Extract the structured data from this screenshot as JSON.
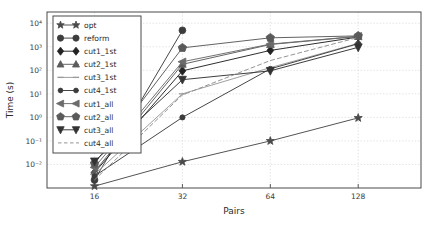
{
  "chart_data": {
    "type": "line",
    "title": "",
    "xlabel": "Pairs",
    "ylabel": "Time (s)",
    "xscale": "log2",
    "yscale": "log10",
    "x": [
      16,
      32,
      64,
      128
    ],
    "xticklabels": [
      "16",
      "32",
      "64",
      "128"
    ],
    "yticklabels": [
      "10⁴",
      "10³",
      "10²",
      "10¹",
      "10⁰",
      "10⁻¹",
      "10⁻²"
    ],
    "ylim": [
      0.001,
      30000
    ],
    "xlim": [
      11,
      210
    ],
    "grid": true,
    "legend_position": "upper-left",
    "series": [
      {
        "name": "opt",
        "marker": "star",
        "dash": "solid",
        "color": "#4a4a4a",
        "values": [
          0.0012,
          0.013,
          0.1,
          0.95
        ]
      },
      {
        "name": "reform",
        "marker": "circle",
        "dash": "solid",
        "color": "#3c3c3c",
        "values": [
          0.0022,
          5000,
          null,
          null
        ]
      },
      {
        "name": "cut1_1st",
        "marker": "diamond",
        "dash": "solid",
        "color": "#232323",
        "values": [
          0.0045,
          95,
          700,
          2600
        ]
      },
      {
        "name": "cut2_1st",
        "marker": "triangle-up",
        "dash": "solid",
        "color": "#5c5c5c",
        "values": [
          0.005,
          180,
          1250,
          2750
        ]
      },
      {
        "name": "cut3_1st",
        "marker": "hline",
        "dash": "solid",
        "color": "#9a9a9a",
        "values": [
          0.0038,
          10,
          130,
          1400
        ]
      },
      {
        "name": "cut4_1st",
        "marker": "circle-small",
        "dash": "solid",
        "color": "#3c3c3c",
        "values": [
          0.0032,
          1.0,
          115,
          1350
        ]
      },
      {
        "name": "cut1_all",
        "marker": "triangle-left",
        "dash": "solid",
        "color": "#6b6b6b",
        "values": [
          0.0075,
          230,
          1300,
          2800
        ]
      },
      {
        "name": "cut2_all",
        "marker": "pentagon",
        "dash": "solid",
        "color": "#5a5a5a",
        "values": [
          0.011,
          900,
          2400,
          2900
        ]
      },
      {
        "name": "cut3_all",
        "marker": "triangle-down",
        "dash": "solid",
        "color": "#333333",
        "values": [
          0.0135,
          40,
          95,
          950
        ]
      },
      {
        "name": "cut4_all",
        "marker": "none",
        "dash": "dashed",
        "color": "#8e8e8e",
        "values": [
          0.0022,
          9,
          260,
          2500
        ]
      }
    ]
  },
  "legend": {
    "items": [
      {
        "label": "opt"
      },
      {
        "label": "reform"
      },
      {
        "label": "cut1_1st"
      },
      {
        "label": "cut2_1st"
      },
      {
        "label": "cut3_1st"
      },
      {
        "label": "cut4_1st"
      },
      {
        "label": "cut1_all"
      },
      {
        "label": "cut2_all"
      },
      {
        "label": "cut3_all"
      },
      {
        "label": "cut4_all"
      }
    ]
  }
}
